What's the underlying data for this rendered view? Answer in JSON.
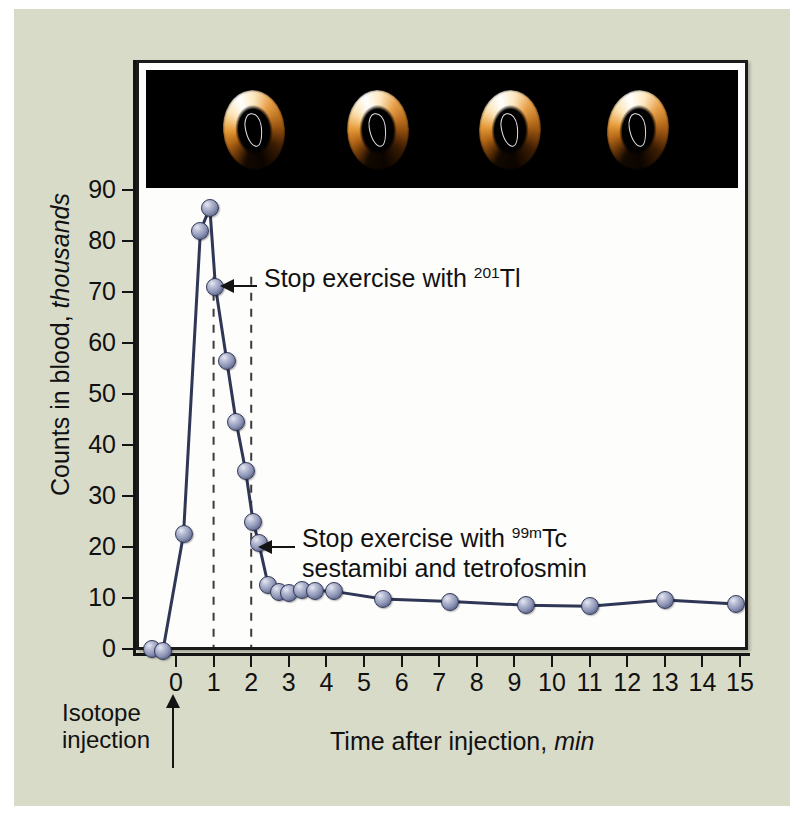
{
  "figure": {
    "background_color": "#d9dbc9",
    "panel_color": "#fdfdfb",
    "marker_color": "#8d95b6",
    "line_color": "#2f3656"
  },
  "axes": {
    "y_title_main": "Counts in blood,",
    "y_title_italic": "thousands",
    "x_title_main": "Time after injection,",
    "x_title_italic": "min",
    "y_ticks": [
      "0",
      "10",
      "20",
      "30",
      "40",
      "50",
      "60",
      "70",
      "80",
      "90"
    ],
    "x_ticks": [
      "0",
      "1",
      "2",
      "3",
      "4",
      "5",
      "6",
      "7",
      "8",
      "9",
      "10",
      "11",
      "12",
      "13",
      "14",
      "15"
    ]
  },
  "injection_marker": {
    "line1": "Isotope",
    "line2": "injection"
  },
  "annotations": [
    {
      "id": "tl-201",
      "line1_pre": "Stop exercise with ",
      "line1_sup": "201",
      "line1_post": "Tl",
      "line2_pre": "",
      "line2_sup": "",
      "line2_post": ""
    },
    {
      "id": "tc-99m",
      "line1_pre": "Stop exercise with ",
      "line1_sup": "99m",
      "line1_post": "Tc",
      "line2_pre": "sestamibi and tetrofosmin",
      "line2_sup": "",
      "line2_post": ""
    }
  ],
  "spect_images": {
    "count": 4,
    "description": "short-axis myocardial perfusion rings",
    "background_color": "#000000"
  },
  "chart_data": {
    "type": "line",
    "title": "",
    "xlabel": "Time after injection, min",
    "ylabel": "Counts in blood, thousands",
    "xlim": [
      -0.7,
      15.4
    ],
    "ylim": [
      0,
      93
    ],
    "grid": false,
    "legend": "none",
    "x": [
      -0.65,
      -0.35,
      0.2,
      0.65,
      0.9,
      1.05,
      1.35,
      1.6,
      1.85,
      2.05,
      2.2,
      2.45,
      2.75,
      3.0,
      3.35,
      3.7,
      4.2,
      5.5,
      7.3,
      9.3,
      11.0,
      13.0,
      14.9
    ],
    "y": [
      0.0,
      -0.4,
      22.5,
      82.0,
      86.5,
      71.0,
      56.5,
      44.5,
      35.0,
      25.0,
      20.8,
      12.6,
      11.2,
      11.0,
      11.5,
      11.4,
      11.3,
      9.8,
      9.3,
      8.6,
      8.4,
      9.6,
      8.8
    ],
    "vertical_dashed_lines": [
      1.0,
      2.0
    ],
    "annotation_points": [
      {
        "label": "Stop exercise with 201Tl",
        "x": 1.05,
        "y": 71.0
      },
      {
        "label": "Stop exercise with 99mTc sestamibi and tetrofosmin",
        "x": 2.2,
        "y": 20.8
      }
    ]
  }
}
